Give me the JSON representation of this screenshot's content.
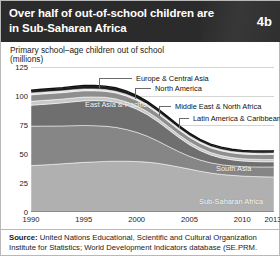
{
  "header": {
    "title": "Over half of out-of-school children are in Sub-Saharan Africa",
    "badge": "4b"
  },
  "source": {
    "label": "Source:",
    "text": " United Nations Educational, Scientific and Cultural Organization Institute for Statistics; World Development Indicators database (SE.PRM."
  },
  "colors": {
    "header_bg": "#2b2b2b",
    "page_bg": "#ffffff",
    "grid": "#d4d4d4",
    "axis": "#8c8c8c",
    "europe_central_asia": "#1c1c1c",
    "north_america": "#e0e0e0",
    "middle_east_north_africa": "#8e8e8e",
    "latin_america_caribbean": "#c9c9c9",
    "east_asia_pacific": "#6f6f6f",
    "south_asia": "#868686",
    "sub_saharan_africa": "#b0b0b0"
  },
  "chart_data": {
    "type": "area",
    "title": "Over half of out-of-school children are in Sub-Saharan Africa",
    "subtitle": "Primary school–age children out of school",
    "units": "(millions)",
    "xlabel": "",
    "ylabel": "millions",
    "grid": true,
    "legend_position": "in-chart-callouts",
    "stacked": true,
    "xlim": [
      1990,
      2013
    ],
    "ylim": [
      0,
      125
    ],
    "yticks": [
      0,
      25,
      50,
      75,
      100,
      125
    ],
    "xticks": [
      1990,
      1995,
      2000,
      2005,
      2010,
      2013
    ],
    "x": [
      1990,
      1991,
      1992,
      1993,
      1994,
      1995,
      1996,
      1997,
      1998,
      1999,
      2000,
      2001,
      2002,
      2003,
      2004,
      2005,
      2006,
      2007,
      2008,
      2009,
      2010,
      2011,
      2012,
      2013
    ],
    "series": [
      {
        "name": "Sub-Saharan Africa",
        "color": "#b0b0b0",
        "label_kind": "in-chart",
        "values": [
          40.0,
          40.5,
          41.0,
          41.6,
          42.2,
          42.8,
          43.2,
          43.6,
          43.8,
          43.8,
          43.5,
          43.0,
          42.0,
          40.5,
          38.8,
          37.0,
          35.2,
          33.6,
          32.4,
          31.6,
          31.0,
          30.6,
          30.3,
          30.2
        ]
      },
      {
        "name": "South Asia",
        "color": "#868686",
        "label_kind": "in-chart",
        "values": [
          34.0,
          33.6,
          33.1,
          32.6,
          32.2,
          31.8,
          31.2,
          30.4,
          29.2,
          27.4,
          25.2,
          22.4,
          19.2,
          16.0,
          13.2,
          11.0,
          9.6,
          8.8,
          8.4,
          8.2,
          8.2,
          8.3,
          8.5,
          8.7
        ]
      },
      {
        "name": "East Asia & Pacific",
        "color": "#6f6f6f",
        "label_kind": "in-chart",
        "values": [
          18.0,
          18.6,
          19.2,
          19.9,
          20.6,
          21.2,
          21.6,
          21.8,
          21.6,
          21.0,
          20.0,
          18.6,
          16.8,
          14.6,
          12.2,
          10.0,
          8.2,
          6.8,
          5.8,
          5.2,
          4.8,
          4.6,
          4.5,
          4.4
        ]
      },
      {
        "name": "Latin America & Caribbean",
        "color": "#c9c9c9",
        "label_kind": "callout",
        "values": [
          3.4,
          3.4,
          3.4,
          3.3,
          3.3,
          3.3,
          3.2,
          3.1,
          3.0,
          2.9,
          2.8,
          2.7,
          2.6,
          2.5,
          2.4,
          2.3,
          2.2,
          2.1,
          2.1,
          2.0,
          2.0,
          2.0,
          2.0,
          2.0
        ]
      },
      {
        "name": "Middle East & North Africa",
        "color": "#8e8e8e",
        "label_kind": "callout",
        "values": [
          5.6,
          5.6,
          5.6,
          5.5,
          5.5,
          5.4,
          5.3,
          5.2,
          5.1,
          5.0,
          4.9,
          4.7,
          4.5,
          4.4,
          4.3,
          4.2,
          4.1,
          4.0,
          4.0,
          4.0,
          4.0,
          4.1,
          4.2,
          4.3
        ]
      },
      {
        "name": "North America",
        "color": "#e0e0e0",
        "label_kind": "callout",
        "values": [
          1.6,
          1.6,
          1.6,
          1.6,
          1.6,
          1.6,
          1.6,
          1.5,
          1.5,
          1.5,
          1.5,
          1.4,
          1.4,
          1.4,
          1.3,
          1.3,
          1.3,
          1.2,
          1.2,
          1.2,
          1.2,
          1.2,
          1.2,
          1.2
        ]
      },
      {
        "name": "Europe & Central Asia",
        "color": "#1c1c1c",
        "label_kind": "callout",
        "values": [
          2.4,
          2.5,
          2.6,
          2.7,
          2.8,
          2.9,
          2.9,
          2.9,
          2.9,
          2.8,
          2.7,
          2.6,
          2.5,
          2.4,
          2.3,
          2.2,
          2.1,
          2.0,
          2.0,
          1.9,
          1.9,
          1.9,
          1.9,
          1.9
        ]
      }
    ],
    "in_chart_labels": [
      {
        "text": "East Asia & Pacific",
        "x_px": 54,
        "y_px": 33
      },
      {
        "text": "South Asia",
        "x_px": 185,
        "y_px": 97
      },
      {
        "text": "Sub-Saharan Africa",
        "x_px": 168,
        "y_px": 130
      }
    ],
    "callouts": [
      {
        "text": "Europe & Central Asia",
        "label_x": 101,
        "label_y": 7,
        "anchor_x": 68,
        "anchor_y": 22
      },
      {
        "text": "North America",
        "label_x": 120,
        "label_y": 17,
        "anchor_x": 104,
        "anchor_y": 32
      },
      {
        "text": "Middle East & North Africa",
        "label_x": 140,
        "label_y": 35,
        "anchor_x": 128,
        "anchor_y": 49
      },
      {
        "text": "Latin America & Caribbean",
        "label_x": 158,
        "label_y": 47,
        "anchor_x": 148,
        "anchor_y": 61
      }
    ]
  }
}
